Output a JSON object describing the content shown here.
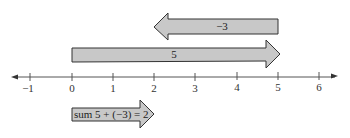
{
  "arrows": {
    "neg3": {
      "label": "−3",
      "from": 5,
      "to": 2
    },
    "pos5": {
      "label": "5",
      "from": 0,
      "to": 5
    },
    "sum": {
      "label": "sum 5 + (−3) = 2",
      "from": 0,
      "to": 2
    }
  },
  "number_line": {
    "ticks": [
      "−1",
      "0",
      "1",
      "2",
      "3",
      "4",
      "5",
      "6"
    ]
  },
  "colors": {
    "arrow_fill": "#c8c8c8",
    "arrow_stroke": "#333333",
    "axis": "#555555"
  }
}
